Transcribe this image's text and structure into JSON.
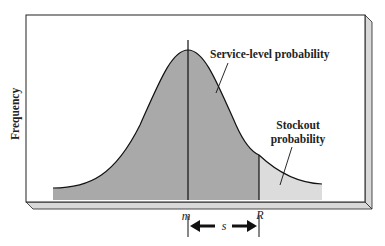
{
  "diagram": {
    "type": "normal-distribution-service-level",
    "y_axis_label": "Frequency",
    "labels": {
      "service_level": "Service-level probability",
      "stockout_line1": "Stockout",
      "stockout_line2": "probability"
    },
    "x_markers": {
      "mean": "m",
      "reorder_point": "R",
      "spread": "s"
    },
    "colors": {
      "service_area": "#a9a9a9",
      "stockout_area": "#dcdcdc",
      "frame_edge": "#d9d9d9",
      "lines": "#111111"
    }
  }
}
